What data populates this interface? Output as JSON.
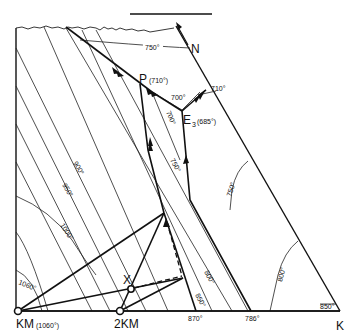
{
  "diagram": {
    "type": "ternary-phase-diagram-liquidus",
    "scale_bar": true,
    "corners": {
      "bottom_left": "KM",
      "bottom_left_temp": "(1060°)",
      "bottom_right": "K",
      "top_right_arrow": "N"
    },
    "points": {
      "P": {
        "label": "P",
        "temp": "(710°)"
      },
      "E3": {
        "label": "E",
        "sub": "3",
        "temp": "(685°)"
      },
      "X": {
        "label": "X"
      },
      "2KM": {
        "label": "2KM"
      }
    },
    "isotherm_labels": {
      "t750_top": "750°",
      "t710": "710°",
      "t700_a": "700°",
      "t700_b": "700°",
      "t750_mid": "750°",
      "t750_right": "750°",
      "t900": "900°",
      "t950": "950°",
      "t1000": "1000°",
      "t1060": "1060°",
      "t800_mid": "800°",
      "t850_mid": "850°",
      "t800_right": "800°",
      "t850_corner": "850°"
    },
    "axis_labels": {
      "t870": "870°",
      "t786": "786°"
    }
  }
}
